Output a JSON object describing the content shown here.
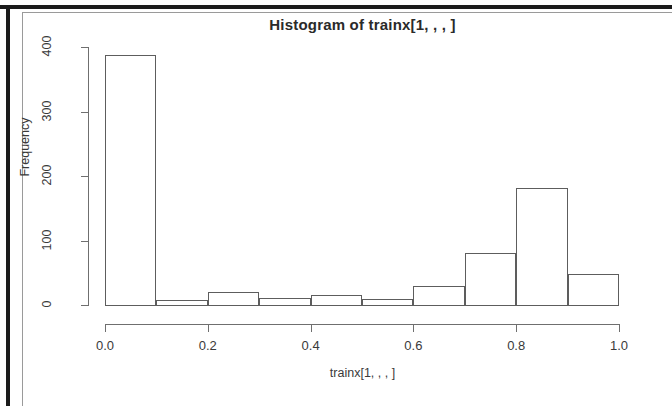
{
  "figure": {
    "title": "Histogram of trainx[1, , , ]",
    "xlabel": "trainx[1, , , ]",
    "ylabel": "Frequency"
  },
  "chart_data": {
    "type": "bar",
    "title": "Histogram of trainx[1, , , ]",
    "xlabel": "trainx[1, , , ]",
    "ylabel": "Frequency",
    "xlim": [
      0.0,
      1.0
    ],
    "ylim": [
      0,
      400
    ],
    "grid": false,
    "legend": null,
    "xticks": [
      0.0,
      0.2,
      0.4,
      0.6,
      0.8,
      1.0
    ],
    "xtick_labels": [
      "0.0",
      "0.2",
      "0.4",
      "0.6",
      "0.8",
      "1.0"
    ],
    "yticks": [
      0,
      100,
      200,
      300,
      400
    ],
    "ytick_labels": [
      "0",
      "100",
      "200",
      "300",
      "400"
    ],
    "bin_width": 0.1,
    "bin_edges": [
      0.0,
      0.1,
      0.2,
      0.3,
      0.4,
      0.5,
      0.6,
      0.7,
      0.8,
      0.9,
      1.0
    ],
    "categories": [
      "0.0-0.1",
      "0.1-0.2",
      "0.2-0.3",
      "0.3-0.4",
      "0.4-0.5",
      "0.5-0.6",
      "0.6-0.7",
      "0.7-0.8",
      "0.8-0.9",
      "0.9-1.0"
    ],
    "values": [
      387,
      8,
      20,
      11,
      15,
      9,
      29,
      81,
      181,
      48
    ]
  }
}
